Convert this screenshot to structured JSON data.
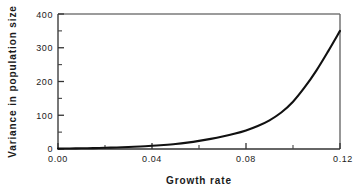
{
  "chart_data": {
    "type": "line",
    "title": "",
    "xlabel": "Growth rate",
    "ylabel": "Variance in population size",
    "xlim": [
      0.0,
      0.12
    ],
    "ylim": [
      0,
      400
    ],
    "grid": false,
    "legend": null,
    "x_major_ticks": [
      0.0,
      0.04,
      0.08,
      0.12
    ],
    "x_major_tick_labels": [
      "0.00",
      "0.04",
      "0.08",
      "0.12"
    ],
    "x_minor_ticks": [
      0.02,
      0.06,
      0.1
    ],
    "y_major_ticks": [
      0,
      100,
      200,
      300,
      400
    ],
    "y_major_tick_labels": [
      "0",
      "100",
      "200",
      "300",
      "400"
    ],
    "y_minor_ticks": [
      50,
      150,
      250,
      350
    ],
    "series": [
      {
        "name": "variance",
        "color": "#111111",
        "line_width": 2.1,
        "x": [
          0.0,
          0.005,
          0.01,
          0.015,
          0.02,
          0.025,
          0.03,
          0.035,
          0.04,
          0.045,
          0.05,
          0.055,
          0.06,
          0.065,
          0.07,
          0.075,
          0.08,
          0.085,
          0.09,
          0.095,
          0.1,
          0.105,
          0.11,
          0.115,
          0.12
        ],
        "y": [
          1,
          1.5,
          2,
          2.5,
          3.5,
          4.5,
          6,
          7.5,
          9.5,
          12,
          15,
          19,
          24,
          30,
          37,
          45,
          55,
          68,
          85,
          108,
          140,
          183,
          233,
          290,
          350
        ]
      }
    ]
  },
  "axes": {
    "x_axis_name": "growth-rate-axis",
    "y_axis_name": "variance-axis",
    "frame_color": "#6e6e6e",
    "spine_color": "#5a5a5a"
  }
}
